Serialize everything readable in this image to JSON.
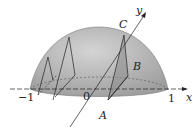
{
  "figure": {
    "labels": {
      "A": "A",
      "B": "B",
      "C": "C",
      "x_axis": "x",
      "y_axis": "y",
      "tick_neg1": "−1",
      "tick_0": "0",
      "tick_1": "1"
    },
    "colors": {
      "dome_fill": "#b5b5b5",
      "dome_dark": "#9a9a9a",
      "lines": "#222222",
      "section_fill": "#8a8a8a"
    }
  }
}
